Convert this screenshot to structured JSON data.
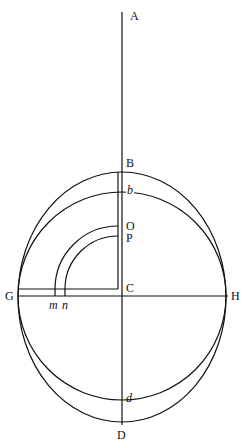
{
  "diagram": {
    "stroke_color": "#111111",
    "background": "#ffffff",
    "labels": {
      "A": "A",
      "B": "B",
      "b": "b",
      "O": "O",
      "P": "P",
      "C": "C",
      "G": "G",
      "H": "H",
      "m": "m",
      "n": "n",
      "d": "d",
      "D": "D"
    },
    "geometry": {
      "center": [
        122,
        296
      ],
      "circle_radius": 104,
      "ellipse_rx": 104,
      "ellipse_ry": 125,
      "axis_top_y": 12,
      "axis_bottom_y": 425,
      "arc_center": [
        118,
        289
      ],
      "arc_O_radius": 63,
      "arc_P_radius": 53
    }
  }
}
